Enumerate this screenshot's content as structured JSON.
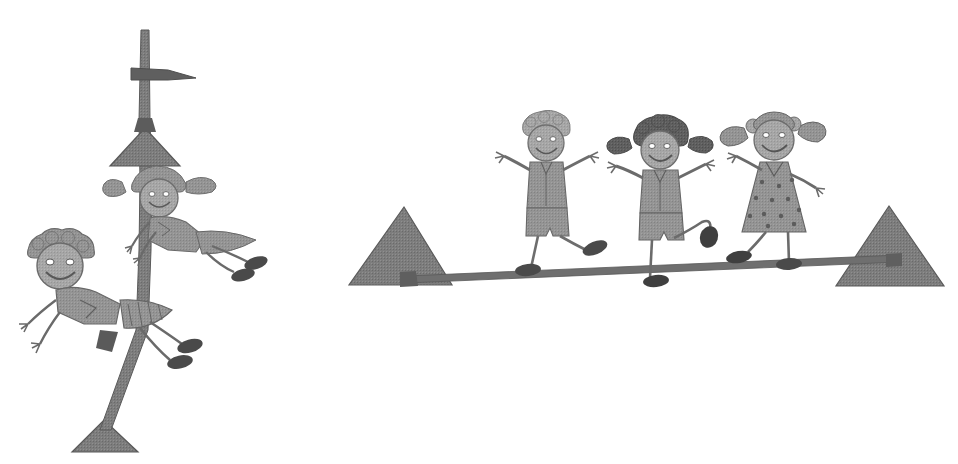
{
  "image": {
    "kind": "grayscale-clipart-illustration",
    "title": "Children climbing a pole and balancing on a beam",
    "width": 958,
    "height": 464,
    "background_color": "#ffffff",
    "style_note": "scanned halftone black-and-white clipart, stick-figure children"
  },
  "palette": {
    "background": "#ffffff",
    "outline_dark": "#4a4a4a",
    "structure_gray": "#7a7a7a",
    "skin_gray": "#9b9b9b",
    "clothes_light": "#a9a9a9",
    "clothes_mid": "#8e8e8e",
    "hair_dark": "#5c5c5c",
    "hair_light": "#b4b4b4",
    "shoe_dark": "#3f3f3f"
  },
  "scenes": [
    {
      "id": "pole-scene",
      "name": "Pole climbing scene",
      "label": "Two children climbing a vertical pole",
      "elements": [
        {
          "name": "vertical-pole",
          "label": "Vertical pole"
        },
        {
          "name": "pole-crossbar",
          "label": "Pole crossbar near top"
        },
        {
          "name": "pole-upper-triangle",
          "label": "Upper triangular bracket"
        },
        {
          "name": "pole-base-triangle",
          "label": "Triangular base stand"
        }
      ],
      "children": [
        {
          "name": "climbing-girl",
          "label": "Girl climbing near top of pole",
          "hair": "pigtails",
          "hair_color": "#9b9b9b",
          "clothing": "shirt and skirt",
          "pose": "horizontal, hanging off pole"
        },
        {
          "name": "climbing-boy",
          "label": "Boy climbing lower on pole",
          "hair": "curly",
          "hair_color": "#8e8e8e",
          "clothing": "shirt and shorts",
          "pose": "horizontal, hanging off pole"
        }
      ]
    },
    {
      "id": "beam-scene",
      "name": "Balance beam scene",
      "label": "Three children balancing on a beam between two triangular supports",
      "elements": [
        {
          "name": "balance-beam",
          "label": "Balance beam"
        },
        {
          "name": "left-triangle-support",
          "label": "Left triangular support"
        },
        {
          "name": "right-triangle-support",
          "label": "Right triangular support"
        }
      ],
      "children": [
        {
          "name": "beam-child-left",
          "label": "Child on left of beam",
          "hair": "short curly light",
          "hair_color": "#b4b4b4",
          "clothing": "shirt and shorts",
          "pose": "arms raised, one leg kicked back"
        },
        {
          "name": "beam-child-middle",
          "label": "Child in middle of beam",
          "hair": "dark pigtails",
          "hair_color": "#5c5c5c",
          "clothing": "shirt and shorts",
          "pose": "arms raised, one leg kicked up behind"
        },
        {
          "name": "beam-child-right",
          "label": "Child on right of beam",
          "hair": "pigtails with bows",
          "hair_color": "#8e8e8e",
          "clothing": "polka dot dress",
          "pose": "arms out, one leg lifted"
        }
      ]
    }
  ],
  "accessibility": {
    "alt_text": "Black and white clipart drawing: on the left two cartoon children climb a tall pole mounted on a triangular base; on the right three cartoon children balance and play on a beam resting between two triangular supports."
  }
}
